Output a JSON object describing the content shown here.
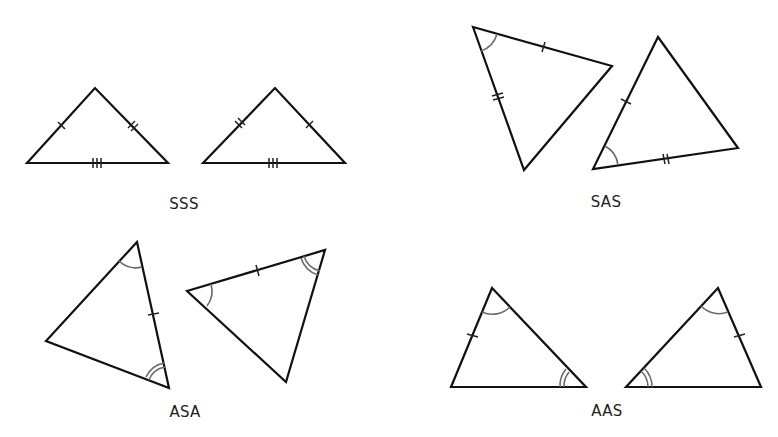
{
  "diagram": {
    "stroke_color": "#111111",
    "arc_color": "#6a6a6a",
    "groups": [
      {
        "id": "sss",
        "label": "SSS",
        "label_pos": [
          184,
          197
        ],
        "triangles": [
          {
            "vertices": [
              [
                27,
                163
              ],
              [
                95,
                88
              ],
              [
                168,
                163
              ]
            ]
          },
          {
            "vertices": [
              [
                203,
                163
              ],
              [
                275,
                88
              ],
              [
                345,
                163
              ]
            ]
          }
        ]
      },
      {
        "id": "sas",
        "label": "SAS",
        "label_pos": [
          606,
          195
        ],
        "triangles": [
          {
            "vertices": [
              [
                473,
                27
              ],
              [
                612,
                66
              ],
              [
                524,
                170
              ]
            ]
          },
          {
            "vertices": [
              [
                658,
                37
              ],
              [
                738,
                148
              ],
              [
                593,
                169
              ]
            ]
          }
        ]
      },
      {
        "id": "asa",
        "label": "ASA",
        "label_pos": [
          185,
          405
        ],
        "triangles": [
          {
            "vertices": [
              [
                137,
                242
              ],
              [
                46,
                341
              ],
              [
                169,
                388
              ]
            ]
          },
          {
            "vertices": [
              [
                187,
                291
              ],
              [
                325,
                250
              ],
              [
                286,
                382
              ]
            ]
          }
        ]
      },
      {
        "id": "aas",
        "label": "AAS",
        "label_pos": [
          607,
          404
        ],
        "triangles": [
          {
            "vertices": [
              [
                492,
                288
              ],
              [
                451,
                387
              ],
              [
                586,
                387
              ]
            ]
          },
          {
            "vertices": [
              [
                718,
                288
              ],
              [
                626,
                387
              ],
              [
                761,
                387
              ]
            ]
          }
        ]
      }
    ]
  }
}
